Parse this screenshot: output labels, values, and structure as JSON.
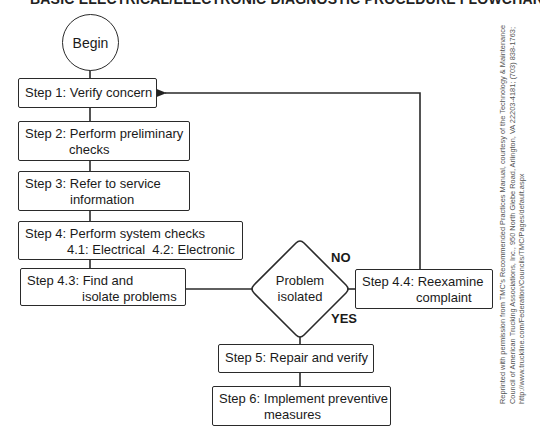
{
  "title": "BASIC ELECTRICAL/ELECTRONIC DIAGNOSTIC PROCEDURE FLOWCHART",
  "nodes": {
    "begin": "Begin",
    "step1": "Step 1: Verify concern",
    "step2": {
      "line1": "Step 2: Perform preliminary",
      "line2": "checks"
    },
    "step3": {
      "line1": "Step 3: Refer to service",
      "line2": "information"
    },
    "step4": {
      "line1": "Step 4: Perform system checks",
      "line2": "4.1: Electrical  4.2: Electronic"
    },
    "step4_3": {
      "line1": "Step 4.3: Find and",
      "line2": "isolate problems"
    },
    "decision": {
      "line1": "Problem",
      "line2": "isolated"
    },
    "step4_4": {
      "line1": "Step 4.4: Reexamine",
      "line2": "complaint"
    },
    "step5": "Step 5: Repair and verify",
    "step6": {
      "line1": "Step 6: Implement preventive",
      "line2": "measures"
    }
  },
  "branches": {
    "no": "NO",
    "yes": "YES"
  },
  "credit": {
    "line1": "Reprinted with permission from TMC's Recommended Practices Manual, courtesy of the Technology & Maintenance",
    "line2": "Council of American Trucking Associations, Inc., 950 North Glebe Road, Arlington, VA 22203-4181; (703) 838-1763;",
    "line3": "http://www.truckline.com/Federation/Councils/TMC/Pages/default.aspx"
  }
}
